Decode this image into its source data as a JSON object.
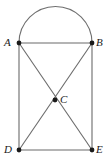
{
  "figure": {
    "kind": "geometry-diagram",
    "canvas": {
      "width": 109,
      "height": 166,
      "background": "#ffffff"
    },
    "colors": {
      "line": "#6b6b6b",
      "arc": "#6f6f6f",
      "vertex": "#1a1a1a",
      "label": "#1a1a1a",
      "background": "#ffffff"
    },
    "vertices": [
      {
        "id": "A",
        "label": "A",
        "x": 19,
        "y": 43,
        "label_position": "left"
      },
      {
        "id": "B",
        "label": "B",
        "x": 92,
        "y": 43,
        "label_position": "right"
      },
      {
        "id": "C",
        "label": "C",
        "x": 55,
        "y": 100,
        "label_position": "right"
      },
      {
        "id": "D",
        "label": "D",
        "x": 19,
        "y": 150,
        "label_position": "left"
      },
      {
        "id": "E",
        "label": "E",
        "x": 92,
        "y": 150,
        "label_position": "right"
      }
    ],
    "edges": [
      {
        "id": "AB",
        "from": "A",
        "to": "B",
        "x1": 19,
        "y1": 43,
        "x2": 92,
        "y2": 43
      },
      {
        "id": "AD",
        "from": "A",
        "to": "D",
        "x1": 19,
        "y1": 43,
        "x2": 19,
        "y2": 150
      },
      {
        "id": "BE",
        "from": "B",
        "to": "E",
        "x1": 92,
        "y1": 43,
        "x2": 92,
        "y2": 150
      },
      {
        "id": "DE",
        "from": "D",
        "to": "E",
        "x1": 19,
        "y1": 150,
        "x2": 92,
        "y2": 150
      },
      {
        "id": "AE",
        "from": "A",
        "to": "E",
        "x1": 19,
        "y1": 43,
        "x2": 92,
        "y2": 150
      },
      {
        "id": "BD",
        "from": "B",
        "to": "D",
        "x1": 92,
        "y1": 43,
        "x2": 19,
        "y2": 150
      }
    ],
    "arc": {
      "id": "arc-AB",
      "from": "A",
      "to": "B",
      "type": "semicircle",
      "center_x": 55.5,
      "center_y": 43,
      "radius": 36.5,
      "apex_y": 6,
      "path": "M 19 43 A 36.5 36.5 0 0 1 92 43"
    },
    "vertex_dot_radius": 2.4
  }
}
